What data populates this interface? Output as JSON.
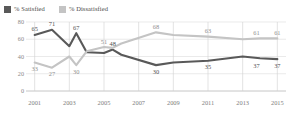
{
  "legend": {
    "items": [
      {
        "label": "% Satisfied",
        "color": "#595959",
        "icon": "square-swatch-icon"
      },
      {
        "label": "% Dissatisfied",
        "color": "#c4c4c4",
        "icon": "square-swatch-icon"
      }
    ]
  },
  "chart_data": {
    "type": "line",
    "title": "",
    "subtitle": "",
    "xlabel": "",
    "ylabel": "",
    "grid": true,
    "legend_position": "top-left",
    "ylim": [
      0,
      80
    ],
    "xlim": [
      2000.5,
      2015.5
    ],
    "yticks": [
      "0",
      "20",
      "40",
      "60",
      "80"
    ],
    "ytick_values": [
      0,
      20,
      40,
      60,
      80
    ],
    "xticks": [
      "2001",
      "2003",
      "2005",
      "2007",
      "2009",
      "2011",
      "2013",
      "2015"
    ],
    "xtick_values": [
      2001,
      2003,
      2005,
      2007,
      2009,
      2011,
      2013,
      2015
    ],
    "x": [
      2001,
      2002,
      2003,
      2003.4,
      2004,
      2005,
      2005.5,
      2006,
      2008,
      2009,
      2011,
      2013,
      2014,
      2015
    ],
    "series": [
      {
        "name": "% Satisfied",
        "color": "#595959",
        "values": [
          65,
          71,
          52,
          67,
          45,
          44,
          48,
          42,
          30,
          33,
          35,
          40,
          38,
          37
        ],
        "labels": [
          {
            "x": 2001,
            "y": 65,
            "text": "65"
          },
          {
            "x": 2002,
            "y": 71,
            "text": "71"
          },
          {
            "x": 2003.4,
            "y": 67,
            "text": "67"
          },
          {
            "x": 2005.5,
            "y": 48,
            "text": "48"
          },
          {
            "x": 2008,
            "y": 30,
            "text": "30"
          },
          {
            "x": 2011,
            "y": 35,
            "text": "35"
          },
          {
            "x": 2013.8,
            "y": 37,
            "text": "37"
          },
          {
            "x": 2015,
            "y": 37,
            "text": "37"
          }
        ]
      },
      {
        "name": "% Dissatisfied",
        "color": "#c4c4c4",
        "values": [
          33,
          27,
          40,
          30,
          46,
          51,
          50,
          55,
          68,
          65,
          63,
          60,
          61,
          61
        ],
        "labels": [
          {
            "x": 2001,
            "y": 33,
            "text": "33"
          },
          {
            "x": 2002,
            "y": 27,
            "text": "27"
          },
          {
            "x": 2003.4,
            "y": 30,
            "text": "30"
          },
          {
            "x": 2005,
            "y": 51,
            "text": "51"
          },
          {
            "x": 2008,
            "y": 68,
            "text": "68"
          },
          {
            "x": 2011,
            "y": 63,
            "text": "63"
          },
          {
            "x": 2013.8,
            "y": 61,
            "text": "61"
          },
          {
            "x": 2015,
            "y": 61,
            "text": "61"
          }
        ]
      }
    ]
  }
}
